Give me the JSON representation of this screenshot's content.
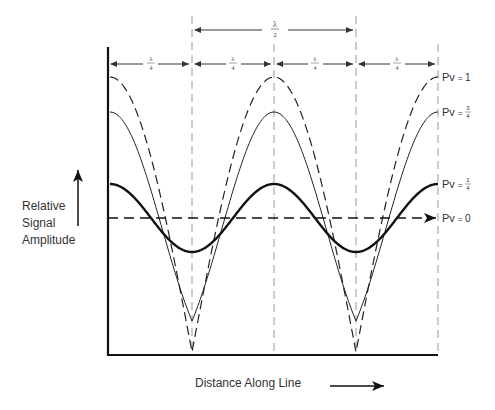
{
  "diagram": {
    "type": "standing-wave-amplitude",
    "y_axis_label": [
      "Relative",
      "Signal",
      "Amplitude"
    ],
    "x_axis_label": "Distance Along Line",
    "spacing_labels": {
      "half_wave": {
        "num": "λ",
        "den": "2"
      },
      "quarter_wave": {
        "num": "λ",
        "den": "4"
      }
    },
    "curves": [
      {
        "id": "pv1",
        "label_prefix": "Pv",
        "label_value": "1",
        "style": "dashed",
        "max_y": 77,
        "min_y": 352
      },
      {
        "id": "pv34",
        "label_prefix": "Pv",
        "label_value_num": "3",
        "label_value_den": "4",
        "style": "thin-solid",
        "max_y": 112,
        "min_y": 321
      },
      {
        "id": "pv14",
        "label_prefix": "Pv",
        "label_value_num": "1",
        "label_value_den": "4",
        "style": "thick-solid",
        "max_y": 184,
        "min_y": 252
      },
      {
        "id": "pv0",
        "label_prefix": "Pv",
        "label_value": "0",
        "style": "dashed-arrow",
        "y": 218
      }
    ],
    "colors": {
      "ink": "#111111",
      "guide": "#999999",
      "text": "#333333"
    }
  }
}
